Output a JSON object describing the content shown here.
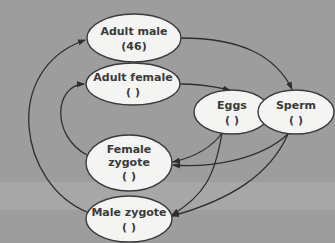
{
  "diagram": {
    "type": "life-cycle",
    "colors": {
      "background": "#9d9d9d",
      "node_fill": "#f4f4f2",
      "node_stroke": "#3a3a3a",
      "arrow": "#2e2e2e",
      "text": "#3a3a3a"
    },
    "nodes": [
      {
        "id": "adult-male",
        "line1": "Adult male",
        "line2": "(46)",
        "line3": ""
      },
      {
        "id": "adult-female",
        "line1": "Adult female",
        "line2": "(  )",
        "line3": ""
      },
      {
        "id": "eggs",
        "line1": "Eggs",
        "line2": "(  )",
        "line3": ""
      },
      {
        "id": "sperm",
        "line1": "Sperm",
        "line2": "(  )",
        "line3": ""
      },
      {
        "id": "female-zygote",
        "line1": "Female",
        "line2": "zygote",
        "line3": "(  )"
      },
      {
        "id": "male-zygote",
        "line1": "Male zygote",
        "line2": "(  )",
        "line3": ""
      }
    ],
    "edges": [
      {
        "from": "adult-male",
        "to": "sperm"
      },
      {
        "from": "adult-female",
        "to": "eggs"
      },
      {
        "from": "eggs",
        "to": "female-zygote"
      },
      {
        "from": "eggs",
        "to": "male-zygote"
      },
      {
        "from": "sperm",
        "to": "female-zygote"
      },
      {
        "from": "sperm",
        "to": "male-zygote"
      },
      {
        "from": "female-zygote",
        "to": "adult-female"
      },
      {
        "from": "male-zygote",
        "to": "adult-male"
      }
    ]
  }
}
